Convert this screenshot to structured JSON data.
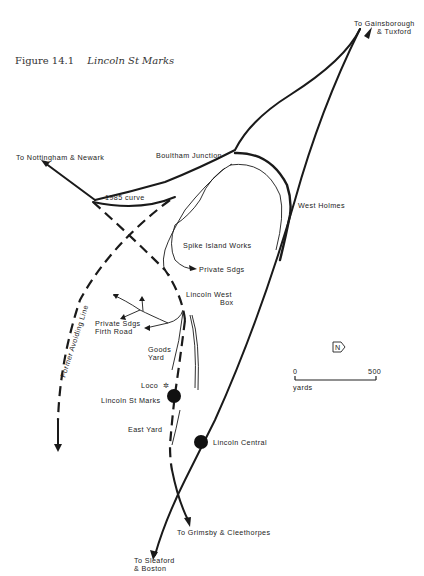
{
  "figure": {
    "number": "Figure 14.1",
    "title": "Lincoln St Marks"
  },
  "labels": {
    "gainsborough_1": "To Gainsborough",
    "gainsborough_2": "& Tuxford",
    "nottingham": "To Nottingham & Newark",
    "boultham_junction": "Boultham Junction",
    "curve_1985": "1985 curve",
    "west_holmes": "West Holmes",
    "spike_island": "Spike Island Works",
    "private_sdgs": "Private Sdgs",
    "lincoln_west_box_1": "Lincoln West",
    "lincoln_west_box_2": "Box",
    "private_sdgs_firth_1": "Private Sdgs",
    "private_sdgs_firth_2": "Firth Road",
    "goods_yard_1": "Goods",
    "goods_yard_2": "Yard",
    "former_avoiding_line": "Former Avoiding Line",
    "loco": "Loco",
    "lincoln_st_marks": "Lincoln St Marks",
    "east_yard": "East Yard",
    "lincoln_central": "Lincoln Central",
    "grimsby": "To Grimsby & Cleethorpes",
    "sleaford_1": "To Sleaford",
    "sleaford_2": "& Boston"
  },
  "scale_bar": {
    "start": "0",
    "end": "500",
    "unit": "yards"
  },
  "north_arrow": {
    "letter": "N"
  },
  "stations": [
    {
      "name": "Lincoln St Marks",
      "x": 175,
      "y": 394
    },
    {
      "name": "Lincoln Central",
      "x": 203,
      "y": 441
    }
  ]
}
